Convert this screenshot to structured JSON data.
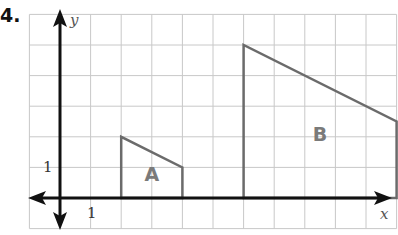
{
  "problem_number": "4.",
  "axes": {
    "x_label": "x",
    "y_label": "y",
    "x_tick_label": "1",
    "y_tick_label": "1"
  },
  "grid": {
    "cols_left_of_y_axis": 1,
    "cols_right_of_y_axis": 11,
    "rows_above_x_axis": 6,
    "rows_below_x_axis": 1
  },
  "shapes": [
    {
      "label": "A",
      "vertices": [
        [
          2,
          0
        ],
        [
          2,
          2
        ],
        [
          4,
          1
        ],
        [
          4,
          0
        ]
      ]
    },
    {
      "label": "B",
      "vertices": [
        [
          6,
          0
        ],
        [
          6,
          5
        ],
        [
          11,
          2.5
        ],
        [
          11,
          0
        ]
      ]
    }
  ],
  "colors": {
    "grid": "#c8c8c8",
    "axis": "#111111",
    "shape_stroke": "#6b6b6b",
    "shape_label": "#7a7a7a"
  }
}
